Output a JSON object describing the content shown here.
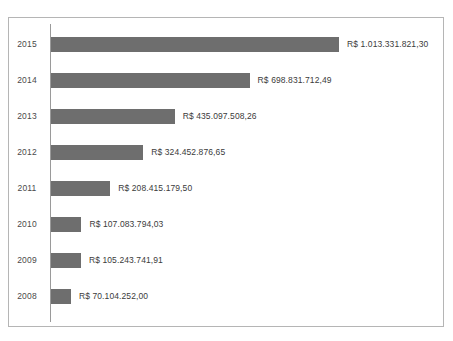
{
  "chart_data": {
    "type": "bar",
    "orientation": "horizontal",
    "title": "",
    "xlabel": "",
    "ylabel": "",
    "currency_prefix": "R$",
    "categories": [
      "2015",
      "2014",
      "2013",
      "2012",
      "2011",
      "2010",
      "2009",
      "2008"
    ],
    "values": [
      1013331821.3,
      698831712.49,
      435097508.26,
      324452876.65,
      208415179.5,
      107083794.03,
      105243741.91,
      70104252.0
    ],
    "value_labels": [
      "R$ 1.013.331.821,30",
      "R$ 698.831.712,49",
      "R$ 435.097.508,26",
      "R$ 324.452.876,65",
      "R$ 208.415.179,50",
      "R$ 107.083.794,03",
      "R$ 105.243.741,91",
      "R$ 70.104.252,00"
    ],
    "xlim": [
      0,
      1013331821.3
    ],
    "grid": false,
    "legend": false,
    "bar_color": "#6e6e6e",
    "axis_color": "#9a9a9a",
    "border_color": "#b5b5b5",
    "label_color": "#3b3b3b",
    "background": "#ffffff"
  },
  "rows": [
    {
      "category": "2015",
      "value_label": "R$ 1.013.331.821,30"
    },
    {
      "category": "2014",
      "value_label": "R$ 698.831.712,49"
    },
    {
      "category": "2013",
      "value_label": "R$ 435.097.508,26"
    },
    {
      "category": "2012",
      "value_label": "R$ 324.452.876,65"
    },
    {
      "category": "2011",
      "value_label": "R$ 208.415.179,50"
    },
    {
      "category": "2010",
      "value_label": "R$ 107.083.794,03"
    },
    {
      "category": "2009",
      "value_label": "R$ 105.243.741,91"
    },
    {
      "category": "2008",
      "value_label": "R$ 70.104.252,00"
    }
  ]
}
